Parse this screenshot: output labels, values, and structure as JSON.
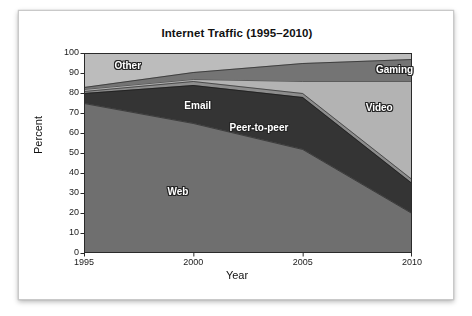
{
  "chart_data": {
    "type": "area",
    "stacked": true,
    "title": "Internet Traffic (1995–2010)",
    "xlabel": "Year",
    "ylabel": "Percent",
    "x": [
      1995,
      2000,
      2005,
      2010
    ],
    "xticklabels": [
      "1995",
      "2000",
      "2005",
      "2010"
    ],
    "xlim": [
      1995,
      2010
    ],
    "ylim": [
      0,
      100
    ],
    "yticks": [
      0,
      10,
      20,
      30,
      40,
      50,
      60,
      70,
      80,
      90,
      100
    ],
    "yticklabels": [
      "0",
      "10",
      "20",
      "30",
      "40",
      "50",
      "60",
      "70",
      "80",
      "90",
      "100"
    ],
    "grid": false,
    "legend": "inline-labels",
    "series": [
      {
        "name": "Web",
        "values": [
          75,
          65,
          52,
          20
        ],
        "color": "#6f6f6f",
        "label_x": 1999.3,
        "label_y": 30
      },
      {
        "name": "Peer-to-peer",
        "values": [
          5,
          19,
          26,
          15
        ],
        "color": "#343434",
        "label_x": 2003.0,
        "label_y": 62
      },
      {
        "name": "Email",
        "values": [
          1,
          2,
          2,
          2
        ],
        "color": "#8d8d8d",
        "label_x": 2000.2,
        "label_y": 73
      },
      {
        "name": "Video",
        "values": [
          1,
          1,
          6,
          49
        ],
        "color": "#b3b3b3",
        "label_x": 2008.5,
        "label_y": 72
      },
      {
        "name": "Gaming",
        "values": [
          1,
          3.5,
          9,
          11
        ],
        "color": "#747474",
        "label_x": 2009.2,
        "label_y": 91
      },
      {
        "name": "Other",
        "values": [
          17,
          9.5,
          5,
          3
        ],
        "color": "#bcbcbc",
        "label_x": 1997.0,
        "label_y": 93
      }
    ],
    "cumulative_tops": {
      "Web": [
        75,
        65,
        52,
        20
      ],
      "Peer-to-peer": [
        80,
        84,
        78,
        35
      ],
      "Email": [
        81,
        86,
        80,
        37
      ],
      "Video": [
        82,
        87,
        86,
        86
      ],
      "Gaming": [
        83,
        90.5,
        95,
        97
      ],
      "Other": [
        100,
        100,
        100,
        100
      ]
    }
  }
}
